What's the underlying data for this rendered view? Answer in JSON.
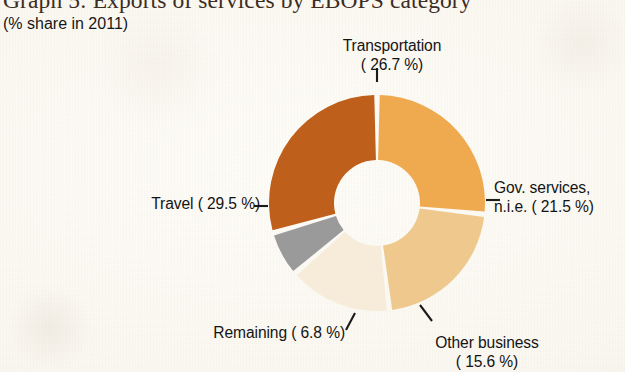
{
  "header": {
    "title": "Graph 5: Exports of services by EBOPS category",
    "subtitle": "(% share in 2011)"
  },
  "chart_data": {
    "type": "pie",
    "variant": "donut",
    "title": "Graph 5: Exports of services by EBOPS category",
    "subtitle": "(% share in 2011)",
    "unit": "% share",
    "year": 2011,
    "xlabel": "",
    "ylabel": "",
    "legend_position": "callout-labels",
    "grid": false,
    "total": 100.1,
    "start_angle_deg": 0,
    "direction": "clockwise",
    "categories": [
      "Transportation",
      "Gov. services, n.i.e.",
      "Other business",
      "Remaining",
      "Travel"
    ],
    "values": [
      26.7,
      21.5,
      15.6,
      6.8,
      29.5
    ],
    "colors": [
      "#efa94e",
      "#eec88d",
      "#f6ecd9",
      "#9a9a9a",
      "#bf5f1c"
    ],
    "slices": [
      {
        "name": "Transportation",
        "value": 26.7,
        "color": "#efa94e",
        "label_line1": "Transportation",
        "label_line2": "( 26.7 %)",
        "label_position": "top"
      },
      {
        "name": "Gov. services, n.i.e.",
        "value": 21.5,
        "color": "#eec88d",
        "label_line1": "Gov. services,",
        "label_line2": "n.i.e. ( 21.5 %)",
        "label_position": "right"
      },
      {
        "name": "Other business",
        "value": 15.6,
        "color": "#f6ecd9",
        "label_line1": "Other business",
        "label_line2": "( 15.6 %)",
        "label_position": "bottom-right"
      },
      {
        "name": "Remaining",
        "value": 6.8,
        "color": "#9a9a9a",
        "label_line1": "Remaining (  6.8 %)",
        "label_line2": "",
        "label_position": "bottom-left"
      },
      {
        "name": "Travel",
        "value": 29.5,
        "color": "#bf5f1c",
        "label_line1": "Travel ( 29.5 %)",
        "label_line2": "",
        "label_position": "left"
      }
    ]
  },
  "labels": {
    "transportation_l1": "Transportation",
    "transportation_l2": "( 26.7 %)",
    "gov_l1": "Gov. services,",
    "gov_l2": "n.i.e. ( 21.5 %)",
    "otherbusiness_l1": "Other business",
    "otherbusiness_l2": "( 15.6 %)",
    "remaining": "Remaining (  6.8 %)",
    "travel": "Travel ( 29.5 %)"
  }
}
